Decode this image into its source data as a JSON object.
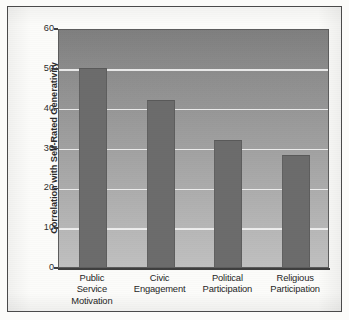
{
  "chart_data": {
    "type": "bar",
    "title": "",
    "xlabel": "",
    "ylabel": "Correlation with Self-Rated Generativity",
    "ylim": [
      0,
      60
    ],
    "ytick_labels": [
      "60",
      "50",
      "40",
      "30",
      "20",
      "10",
      "0"
    ],
    "ytick_values": [
      60,
      50,
      40,
      30,
      20,
      10,
      0
    ],
    "grid": true,
    "legend": "none",
    "categories": [
      "Public Service Motivation",
      "Civic Engagement",
      "Political Participation",
      "Religious Participation"
    ],
    "category_lines": [
      [
        "Public",
        "Service",
        "Motivation"
      ],
      [
        "Civic",
        "Engagement"
      ],
      [
        "Political",
        "Participation"
      ],
      [
        "Religious",
        "Participation"
      ]
    ],
    "values": [
      50,
      42,
      32,
      28
    ],
    "colors": {
      "bar": "#6c6c6c",
      "plot_bg_top": "#7f7f7f",
      "plot_bg_bottom": "#c0c0c0",
      "gridline": "#f2f2f2",
      "axis": "#3f3f3f",
      "text": "#262626",
      "page_bg": "#fbfbf9",
      "frame": "#4a4a4a"
    }
  }
}
